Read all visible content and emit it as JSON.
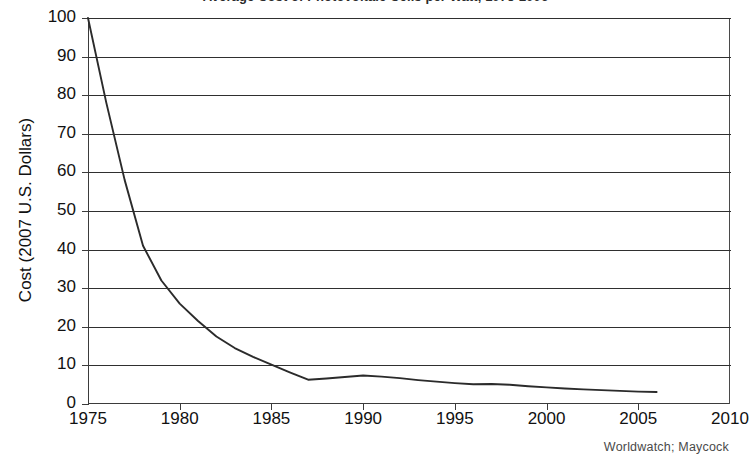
{
  "chart_data": {
    "type": "line",
    "title": "Average Cost of Photovoltaic Cells per Watt, 1975-2006",
    "subtitle": "",
    "xlabel": "",
    "ylabel": "Cost (2007 U.S. Dollars)",
    "source_note": "Worldwatch; Maycock",
    "xlim": [
      1975,
      2010
    ],
    "ylim": [
      0,
      100
    ],
    "grid": "horizontal",
    "legend": "none",
    "x_ticks": [
      "1975",
      "1980",
      "1985",
      "1990",
      "1995",
      "2000",
      "2005",
      "2010"
    ],
    "x_tick_values": [
      1975,
      1980,
      1985,
      1990,
      1995,
      2000,
      2005,
      2010
    ],
    "y_ticks": [
      "0",
      "10",
      "20",
      "30",
      "40",
      "50",
      "60",
      "70",
      "80",
      "90",
      "100"
    ],
    "y_tick_values": [
      0,
      10,
      20,
      30,
      40,
      50,
      60,
      70,
      80,
      90,
      100
    ],
    "series": [
      {
        "name": "Average cost per watt",
        "color": "#2b2b2b",
        "x": [
          1975,
          1976,
          1977,
          1978,
          1979,
          1980,
          1981,
          1982,
          1983,
          1984,
          1985,
          1986,
          1987,
          1988,
          1989,
          1990,
          1991,
          1992,
          1993,
          1994,
          1995,
          1996,
          1997,
          1998,
          1999,
          2000,
          2001,
          2002,
          2003,
          2004,
          2005,
          2006
        ],
        "y": [
          100.0,
          78.0,
          58.0,
          41.0,
          32.0,
          26.0,
          21.5,
          17.5,
          14.5,
          12.2,
          10.2,
          8.2,
          6.3,
          6.6,
          7.0,
          7.4,
          7.1,
          6.7,
          6.2,
          5.8,
          5.4,
          5.1,
          5.2,
          5.0,
          4.6,
          4.3,
          4.0,
          3.8,
          3.6,
          3.4,
          3.2,
          3.1
        ]
      }
    ]
  }
}
